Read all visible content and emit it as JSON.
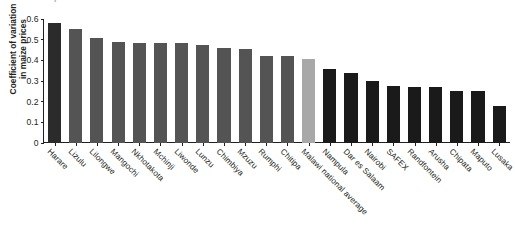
{
  "figure": {
    "title_ghost": "maize prices in selected markets",
    "y_axis_label_line1": "Coefficient of variation",
    "y_axis_label_line2": "in maize prices"
  },
  "chart_data": {
    "type": "bar",
    "title": "",
    "xlabel": "",
    "ylabel": "Coefficient of variation in maize prices",
    "ylim": [
      0,
      0.6
    ],
    "yticks": [
      "0",
      "0.1",
      "0.2",
      "0.3",
      "0.4",
      "0.5",
      "0.6"
    ],
    "ytick_values": [
      0,
      0.1,
      0.2,
      0.3,
      0.4,
      0.5,
      0.6
    ],
    "grid": false,
    "legend": "none",
    "orientation": "vertical",
    "categories": [
      "Harare",
      "Lizulu",
      "Lilongwe",
      "Mangochi",
      "Nkhotakota",
      "Mchinji",
      "Liwonde",
      "Lunzu",
      "Chimbiya",
      "Mzuzu",
      "Rumphi",
      "Chitipa",
      "Malawi national average",
      "Nampula",
      "Dar es Salaam",
      "Nairobi",
      "SAFEX",
      "Randfontein",
      "Arusha",
      "Chipata",
      "Maputo",
      "Lusaka"
    ],
    "values": [
      0.58,
      0.55,
      0.51,
      0.49,
      0.485,
      0.485,
      0.485,
      0.475,
      0.46,
      0.455,
      0.42,
      0.42,
      0.405,
      0.36,
      0.34,
      0.3,
      0.275,
      0.27,
      0.27,
      0.25,
      0.25,
      0.18
    ],
    "bar_colors": [
      "#2b2b2b",
      "#545454",
      "#545454",
      "#545454",
      "#545454",
      "#545454",
      "#545454",
      "#545454",
      "#545454",
      "#545454",
      "#545454",
      "#545454",
      "#a8a8a8",
      "#1a1a1a",
      "#1a1a1a",
      "#1a1a1a",
      "#1a1a1a",
      "#1a1a1a",
      "#1a1a1a",
      "#1a1a1a",
      "#1a1a1a",
      "#1a1a1a"
    ],
    "palette": {
      "highlight_dark": "#2b2b2b",
      "malawi_market": "#545454",
      "national_average": "#a8a8a8",
      "other_market": "#1a1a1a",
      "axis": "#231f20",
      "background": "#ffffff"
    }
  }
}
